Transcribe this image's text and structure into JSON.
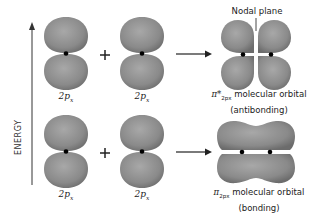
{
  "axis": {
    "label": "ENERGY",
    "direction": "up"
  },
  "top_row": {
    "left_orbital_label": "2p",
    "left_orbital_sub": "x",
    "operator": "+",
    "right_orbital_label": "2p",
    "right_orbital_sub": "x",
    "result": {
      "symbol": "π*",
      "subscript": "2px",
      "label": "molecular orbital",
      "type": "(antibonding)",
      "annotation": "Nodal plane"
    }
  },
  "bottom_row": {
    "left_orbital_label": "2p",
    "left_orbital_sub": "x",
    "operator": "+",
    "right_orbital_label": "2p",
    "right_orbital_sub": "x",
    "result": {
      "symbol": "π",
      "subscript": "2px",
      "label": "molecular orbital",
      "type": "(bonding)"
    }
  },
  "colors": {
    "lobe": "#8a8a8a",
    "lobe_dark": "#6e6e6e",
    "nucleus": "#000000",
    "arrow": "#222222"
  }
}
